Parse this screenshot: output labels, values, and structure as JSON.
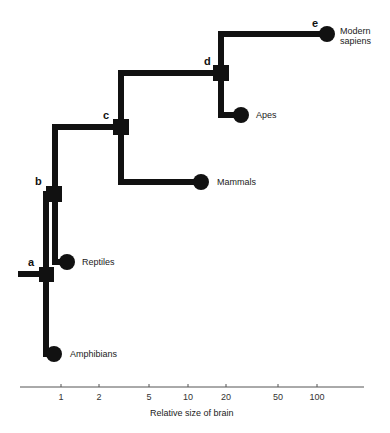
{
  "diagram": {
    "type": "brain-size evolutionary tree",
    "nodes": [
      {
        "id": "a",
        "label": "a"
      },
      {
        "id": "b",
        "label": "b"
      },
      {
        "id": "c",
        "label": "c"
      },
      {
        "id": "d",
        "label": "d"
      },
      {
        "id": "e",
        "label": "e"
      }
    ],
    "leaves": [
      {
        "id": "amphibians",
        "label": "Amphibians"
      },
      {
        "id": "reptiles",
        "label": "Reptiles"
      },
      {
        "id": "mammals",
        "label": "Mammals"
      },
      {
        "id": "apes",
        "label": "Apes"
      },
      {
        "id": "modern_sapiens",
        "label_line1": "Modern",
        "label_line2": "sapiens"
      }
    ],
    "axis": {
      "title": "Relative size of brain",
      "scale": "log",
      "ticks": [
        "1",
        "2",
        "5",
        "10",
        "20",
        "50",
        "100"
      ]
    },
    "colors": {
      "tree": "#111111",
      "axis": "#555555"
    }
  }
}
